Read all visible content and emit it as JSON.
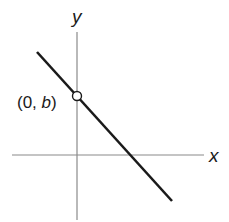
{
  "diagram": {
    "type": "coordinate-plane-line",
    "axes": {
      "x_label": "x",
      "y_label": "y"
    },
    "line": {
      "slope_sign": "negative",
      "description": "line with negative slope crossing positive y-axis and positive x-axis"
    },
    "point": {
      "label_open": "(0, ",
      "label_var": "b",
      "label_close": ")",
      "style": "open-circle"
    },
    "colors": {
      "axis": "#8a8a8a",
      "line": "#1a1a1a",
      "text": "#1a1a1a"
    }
  }
}
